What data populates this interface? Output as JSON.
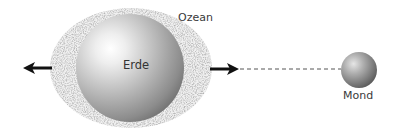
{
  "diagram": {
    "labels": {
      "ocean": "Ozean",
      "earth": "Erde",
      "moon": "Mond"
    },
    "colors": {
      "background": "#ffffff",
      "ocean_stipple": "#9a9a9a",
      "ocean_base": "#e8e8e8",
      "earth_highlight": "#ffffff",
      "earth_shadow": "#6e6e6e",
      "moon_highlight": "#dcdcdc",
      "moon_shadow": "#555555",
      "arrow": "#111111",
      "dashed_line": "#555555",
      "label_text": "#3a3a3a"
    },
    "elements": [
      {
        "id": "ocean",
        "shape": "ellipse",
        "fill": "stippled"
      },
      {
        "id": "earth",
        "shape": "sphere"
      },
      {
        "id": "moon",
        "shape": "sphere"
      },
      {
        "id": "arrow-left",
        "direction": "left"
      },
      {
        "id": "arrow-right",
        "direction": "right",
        "toward": "moon"
      },
      {
        "id": "earth-moon-line",
        "style": "dashed"
      }
    ]
  }
}
